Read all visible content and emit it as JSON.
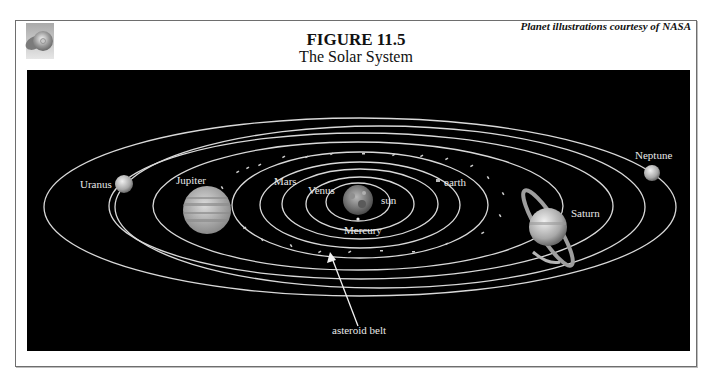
{
  "header": {
    "figure_number": "FIGURE 11.5",
    "figure_title": "The Solar System",
    "credit": "Planet illustrations courtesy of NASA",
    "icon": "cd-disc-icon"
  },
  "colors": {
    "background": "#000000",
    "orbit": "#d9d9d9",
    "label": "#e8e8e8",
    "frame": "#6e6e6e"
  },
  "diagram": {
    "labels": {
      "sun": "sun",
      "mercury": "Mercury",
      "venus": "Venus",
      "earth": "earth",
      "mars": "Mars",
      "jupiter": "Jupiter",
      "saturn": "Saturn",
      "uranus": "Uranus",
      "neptune": "Neptune",
      "asteroid_belt": "asteroid belt"
    }
  }
}
